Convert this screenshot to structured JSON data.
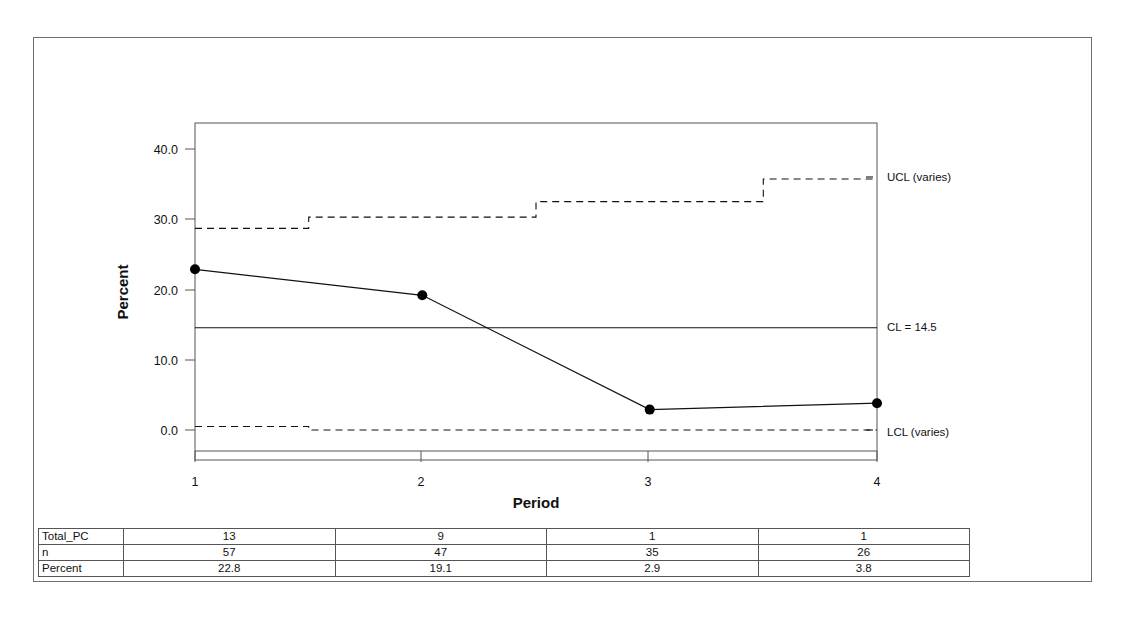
{
  "chart_data": {
    "type": "line",
    "title": "",
    "subtitle": "",
    "xlabel": "Period",
    "ylabel": "Percent",
    "x": [
      1,
      2,
      3,
      4
    ],
    "xtick_labels": [
      "1",
      "2",
      "3",
      "4"
    ],
    "ytick_labels": [
      "40.0",
      "30.0",
      "20.0",
      "10.0",
      "0.0"
    ],
    "ytick_values": [
      40.0,
      30.0,
      20.0,
      10.0,
      0.0
    ],
    "ylim": [
      -3.0,
      43.0
    ],
    "xlim": [
      0.75,
      4.25
    ],
    "grid": false,
    "legend_position": "right-outside",
    "series": [
      {
        "name": "Percent",
        "style": "line-with-markers",
        "values": [
          22.8,
          19.1,
          2.9,
          3.8
        ]
      },
      {
        "name": "UCL (varies)",
        "style": "dashed-step",
        "values": [
          28.6,
          30.2,
          32.4,
          35.6
        ]
      },
      {
        "name": "CL = 14.5",
        "style": "solid",
        "values": [
          14.5,
          14.5,
          14.5,
          14.5
        ]
      },
      {
        "name": "LCL (varies)",
        "style": "dashed-step",
        "values": [
          0.5,
          0.0,
          0.0,
          0.0
        ]
      }
    ],
    "annotations": [
      {
        "name": "ucl-label",
        "text": "UCL (varies)",
        "value": 35.6
      },
      {
        "name": "cl-label",
        "text": "CL = 14.5",
        "value": 14.5
      },
      {
        "name": "lcl-label",
        "text": "LCL (varies)",
        "value": 0.0
      }
    ],
    "center_line_value": 14.5,
    "table": {
      "row_headers": [
        "Total_PC",
        "n",
        "Percent"
      ],
      "rows": [
        {
          "label": "Total_PC",
          "values": [
            "13",
            "9",
            "1",
            "1"
          ]
        },
        {
          "label": "n",
          "values": [
            "57",
            "47",
            "35",
            "26"
          ]
        },
        {
          "label": "Percent",
          "values": [
            "22.8",
            "19.1",
            "2.9",
            "3.8"
          ]
        }
      ]
    }
  },
  "chart": {
    "axis": {
      "x_title": "Period",
      "y_title": "Percent",
      "x_ticks": [
        "1",
        "2",
        "3",
        "4"
      ],
      "y_ticks": [
        "40.0",
        "30.0",
        "20.0",
        "10.0",
        "0.0"
      ]
    },
    "limits": {
      "ucl_label": "UCL (varies)",
      "cl_label": "CL = 14.5",
      "lcl_label": "LCL (varies)"
    }
  },
  "table": {
    "rows": [
      {
        "header": "Total_PC",
        "c1": "13",
        "c2": "9",
        "c3": "1",
        "c4": "1"
      },
      {
        "header": "n",
        "c1": "57",
        "c2": "47",
        "c3": "35",
        "c4": "26"
      },
      {
        "header": "Percent",
        "c1": "22.8",
        "c2": "19.1",
        "c3": "2.9",
        "c4": "3.8"
      }
    ]
  },
  "colors": {
    "line": "#111111",
    "marker": "#000000",
    "frame": "#6f6f6f",
    "axis": "#555555",
    "background": "#ffffff"
  }
}
